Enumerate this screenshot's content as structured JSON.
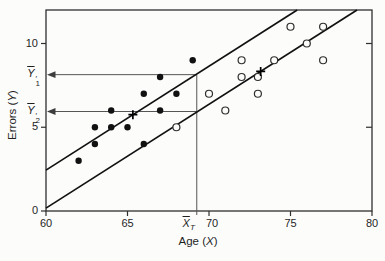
{
  "figure": {
    "background": "#fcfcfb",
    "ink": "#1a1a1a",
    "frame_color": "#2f2f2f",
    "line_color": "#111111",
    "guide_color": "#555555"
  },
  "chart_data": {
    "type": "scatter",
    "title": "",
    "xlabel": {
      "prefix": "Age (",
      "variable": "X",
      "suffix": ")"
    },
    "ylabel": {
      "prefix": "Errors (",
      "variable": "Y",
      "suffix": ")"
    },
    "xlim": [
      60,
      80
    ],
    "ylim": [
      0,
      12
    ],
    "x_ticks": [
      60,
      65,
      70,
      75,
      80
    ],
    "y_ticks_left": [
      0,
      5,
      10
    ],
    "y_ticks_right": [
      5,
      10
    ],
    "grid": false,
    "legend": "none",
    "series": [
      {
        "name": "younger-group",
        "marker": "filled-circle",
        "color": "#111111",
        "points": [
          [
            62,
            3
          ],
          [
            63,
            4
          ],
          [
            63,
            5
          ],
          [
            64,
            5
          ],
          [
            64,
            6
          ],
          [
            65,
            5
          ],
          [
            66,
            4
          ],
          [
            66,
            7
          ],
          [
            67,
            6
          ],
          [
            67,
            8
          ],
          [
            68,
            7
          ],
          [
            69,
            9
          ]
        ],
        "mean": {
          "x": 65.33,
          "y": 5.75,
          "marker": "plus"
        }
      },
      {
        "name": "older-group",
        "marker": "open-circle",
        "color": "#2e2e2e",
        "points": [
          [
            68,
            5
          ],
          [
            70,
            7
          ],
          [
            71,
            6
          ],
          [
            72,
            8
          ],
          [
            72,
            9
          ],
          [
            73,
            7
          ],
          [
            73,
            8
          ],
          [
            74,
            9
          ],
          [
            75,
            11
          ],
          [
            76,
            10
          ],
          [
            77,
            9
          ],
          [
            77,
            11
          ]
        ],
        "mean": {
          "x": 73.17,
          "y": 8.33,
          "marker": "plus"
        }
      }
    ],
    "regression_lines": [
      {
        "series": "younger-group",
        "slope": 0.61,
        "x1": 60,
        "y1": 2.44,
        "x2": 75.41,
        "y2": 12
      },
      {
        "series": "older-group",
        "slope": 0.61,
        "x1": 60,
        "y1": 0.17,
        "x2": 79.08,
        "y2": 12
      }
    ],
    "vertical_line": {
      "x": 69.25,
      "y_top": 8.14,
      "label": {
        "base": "X",
        "overline": true,
        "sub": "T"
      }
    },
    "adjusted_means": [
      {
        "y": 8.14,
        "label": {
          "base": "Y",
          "overline": true,
          "prime": "′",
          "sub": "1"
        }
      },
      {
        "y": 5.94,
        "label": {
          "base": "Y",
          "overline": true,
          "prime": "′",
          "sub": "2"
        }
      }
    ]
  }
}
